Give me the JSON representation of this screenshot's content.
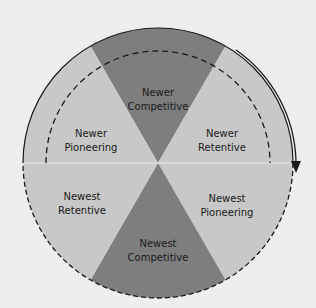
{
  "diagram": {
    "colors": {
      "background": "#eeeeee",
      "light": "#c8c8c8",
      "dark": "#7e7e7e",
      "line": "#1a1a1a"
    },
    "sectors": [
      {
        "line1": "Newer",
        "line2": "Competitive",
        "shade": "dark"
      },
      {
        "line1": "Newer",
        "line2": "Retentive",
        "shade": "light"
      },
      {
        "line1": "Newest",
        "line2": "Pioneering",
        "shade": "light"
      },
      {
        "line1": "Newest",
        "line2": "Competitive",
        "shade": "dark"
      },
      {
        "line1": "Newest",
        "line2": "Retentive",
        "shade": "light"
      },
      {
        "line1": "Newer",
        "line2": "Pioneering",
        "shade": "light"
      }
    ]
  }
}
